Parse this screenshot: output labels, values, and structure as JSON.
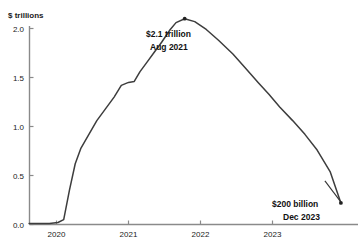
{
  "chart_data": {
    "type": "line",
    "title": "",
    "xlabel": "",
    "ylabel": "$ trillions",
    "ylim": [
      0.0,
      2.2
    ],
    "xlim": [
      2019.6,
      2024.05
    ],
    "grid": false,
    "legend": "none",
    "y_ticks": [
      "0.0",
      "0.5",
      "1.0",
      "1.5",
      "2.0"
    ],
    "y_tick_values": [
      0.0,
      0.5,
      1.0,
      1.5,
      2.0
    ],
    "x_ticks": [
      "2020",
      "2021",
      "2022",
      "2023"
    ],
    "x_tick_values": [
      2020,
      2021,
      2022,
      2023
    ],
    "series": [
      {
        "name": "balance",
        "x": [
          2019.62,
          2019.9,
          2020.02,
          2020.1,
          2020.18,
          2020.26,
          2020.34,
          2020.45,
          2020.56,
          2020.68,
          2020.8,
          2020.9,
          2021.0,
          2021.08,
          2021.16,
          2021.26,
          2021.36,
          2021.46,
          2021.58,
          2021.66,
          2021.78,
          2021.92,
          2022.08,
          2022.25,
          2022.45,
          2022.62,
          2022.8,
          2022.95,
          2023.1,
          2023.28,
          2023.45,
          2023.62,
          2023.8,
          2023.95
        ],
        "y": [
          0.01,
          0.01,
          0.02,
          0.05,
          0.35,
          0.62,
          0.78,
          0.92,
          1.06,
          1.18,
          1.3,
          1.42,
          1.45,
          1.46,
          1.56,
          1.66,
          1.76,
          1.86,
          1.99,
          2.06,
          2.1,
          2.07,
          1.99,
          1.88,
          1.74,
          1.6,
          1.45,
          1.33,
          1.2,
          1.06,
          0.92,
          0.76,
          0.54,
          0.22
        ]
      }
    ],
    "annotations": [
      {
        "id": "peak",
        "line1": "$2.1 trillion",
        "line2": "Aug 2021",
        "point_x": 2021.78,
        "point_y": 2.1
      },
      {
        "id": "end",
        "line1": "$200 billion",
        "line2": "Dec 2023",
        "point_x": 2023.95,
        "point_y": 0.22
      }
    ],
    "colors": {
      "line": "#3d3d3d",
      "axis": "#808080",
      "text": "#1a1a1a",
      "background": "#ffffff"
    }
  }
}
